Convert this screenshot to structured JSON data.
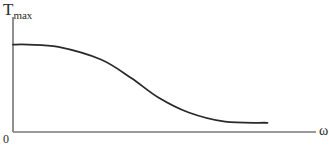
{
  "chart_data": {
    "type": "line",
    "title": "",
    "ylabel": "T",
    "ylabel_subscript": "max",
    "xlabel": "ω",
    "origin_label": "0",
    "grid": false,
    "legend": null,
    "axis_ticks": "none",
    "series": [
      {
        "name": "T_max(ω)",
        "description": "qualitative curve: flat plateau near start, sigmoid-like decline, levels off at a low nonzero value",
        "x": [
          0,
          0.05,
          0.15,
          0.29,
          0.39,
          0.48,
          0.58,
          0.7,
          0.84
        ],
        "y": [
          0.76,
          0.76,
          0.74,
          0.63,
          0.47,
          0.3,
          0.17,
          0.09,
          0.08
        ]
      }
    ],
    "xlim": [
      0,
      1
    ],
    "ylim": [
      0,
      1
    ],
    "colors": {
      "axis": "#555555",
      "curve": "#2a2a2a"
    }
  }
}
